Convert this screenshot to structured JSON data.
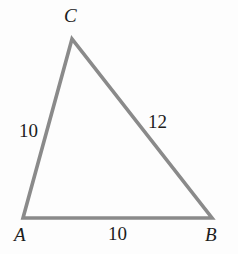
{
  "figure": {
    "kind": "triangle-diagram",
    "background_color": "#fdfdfd",
    "stroke_color": "#8a8a8a",
    "stroke_width": 3.6,
    "label_color": "#1c1c1c",
    "vertices": [
      {
        "name": "A",
        "label": "A",
        "x": 23,
        "y": 218
      },
      {
        "name": "B",
        "label": "B",
        "x": 212,
        "y": 218
      },
      {
        "name": "C",
        "label": "C",
        "x": 72,
        "y": 39
      }
    ],
    "sides": [
      {
        "name": "AC",
        "label": "10",
        "from": "A",
        "to": "C"
      },
      {
        "name": "BC",
        "label": "12",
        "from": "C",
        "to": "B"
      },
      {
        "name": "AB",
        "label": "10",
        "from": "A",
        "to": "B"
      }
    ],
    "path": "M 23 218 L 72 39 L 212 218 Z"
  }
}
